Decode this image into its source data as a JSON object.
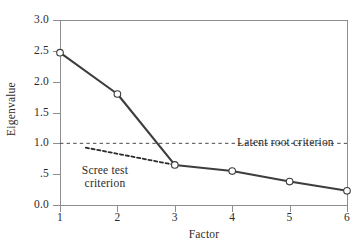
{
  "chart_data": {
    "type": "line",
    "title": "",
    "xlabel": "Factor",
    "ylabel": "Eigenvalue",
    "xlim": [
      1,
      6
    ],
    "ylim": [
      0.0,
      3.0
    ],
    "grid": false,
    "legend": "none",
    "x": [
      1,
      2,
      3,
      4,
      5,
      6
    ],
    "categories": [
      "1",
      "2",
      "3",
      "4",
      "5",
      "6"
    ],
    "series": [
      {
        "name": "Eigenvalue",
        "values": [
          2.47,
          1.8,
          0.65,
          0.55,
          0.38,
          0.23
        ],
        "marker": "open-circle",
        "color": "#3d3d3d"
      }
    ],
    "xticks": [
      "1",
      "2",
      "3",
      "4",
      "5",
      "6"
    ],
    "xtick_values": [
      1,
      2,
      3,
      4,
      5,
      6
    ],
    "yticks": [
      "0.0",
      ".5",
      "1.0",
      "1.5",
      "2.0",
      "2.5",
      "3.0"
    ],
    "ytick_values": [
      0.0,
      0.5,
      1.0,
      1.5,
      2.0,
      2.5,
      3.0
    ],
    "reference_lines": [
      {
        "name": "latent-root-criterion",
        "label": "Latent root criterion",
        "style": "dashed",
        "y": 1.0,
        "x_start": 1.0,
        "x_end": 6.0,
        "color": "#4a4a4a"
      },
      {
        "name": "scree-test-criterion",
        "label": "Scree test criterion",
        "label_line1": "Scree test",
        "label_line2": "criterion",
        "style": "dashed-bold",
        "x_start": 1.45,
        "y_start": 0.93,
        "x_end": 3.0,
        "y_end": 0.65,
        "color": "#2b2b2b"
      }
    ]
  },
  "axes": {
    "x_title": "Factor",
    "y_title": "Eigenvalue"
  },
  "annotations": {
    "latent_root": "Latent root criterion",
    "scree_line1": "Scree test",
    "scree_line2": "criterion"
  },
  "colors": {
    "line": "#3d3d3d",
    "axis": "#8d8d8d",
    "text": "#2b2b2b",
    "background": "#ffffff",
    "marker_fill": "#ffffff"
  }
}
